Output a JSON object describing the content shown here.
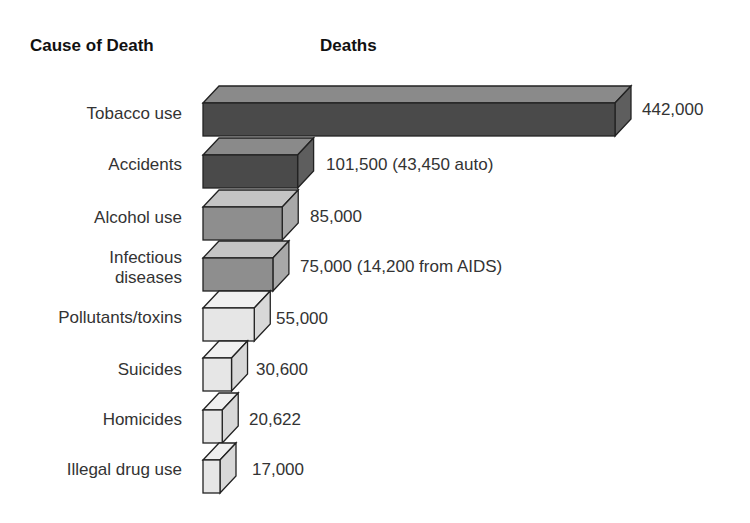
{
  "chart_data": {
    "type": "bar",
    "orientation": "horizontal",
    "style": "3d",
    "title": "",
    "xlabel": "Deaths",
    "ylabel": "Cause of Death",
    "categories": [
      "Tobacco use",
      "Accidents",
      "Alcohol use",
      "Infectious diseases",
      "Pollutants/toxins",
      "Suicides",
      "Homicides",
      "Illegal drug use"
    ],
    "values": [
      442000,
      101500,
      85000,
      75000,
      55000,
      30600,
      20622,
      17000
    ],
    "data_labels": [
      "442,000",
      "101,500 (43,450 auto)",
      "85,000",
      "75,000 (14,200 from AIDS)",
      "55,000",
      "30,600",
      "20,622",
      "17,000"
    ],
    "annotations": {
      "Accidents": "43,450 auto",
      "Infectious diseases": "14,200 from AIDS"
    },
    "grid": false,
    "legend": null
  },
  "headers": {
    "cause": "Cause of Death",
    "deaths": "Deaths"
  },
  "rows": [
    {
      "label": "Tobacco use",
      "value_label": "442,000",
      "front": "#4a4a4a",
      "top": "#8a8a8a",
      "side": "#5e5e5e"
    },
    {
      "label": "Accidents",
      "value_label": "101,500 (43,450 auto)",
      "front": "#4a4a4a",
      "top": "#8a8a8a",
      "side": "#5e5e5e"
    },
    {
      "label": "Alcohol use",
      "value_label": "85,000",
      "front": "#8e8e8e",
      "top": "#c4c4c4",
      "side": "#a8a8a8"
    },
    {
      "label_line1": "Infectious",
      "label_line2": "diseases",
      "value_label": "75,000 (14,200 from AIDS)",
      "front": "#8e8e8e",
      "top": "#c4c4c4",
      "side": "#a8a8a8"
    },
    {
      "label": "Pollutants/toxins",
      "value_label": "55,000",
      "front": "#e6e6e6",
      "top": "#f0f0f0",
      "side": "#d8d8d8"
    },
    {
      "label": "Suicides",
      "value_label": "30,600",
      "front": "#e6e6e6",
      "top": "#f0f0f0",
      "side": "#d8d8d8"
    },
    {
      "label": "Homicides",
      "value_label": "20,622",
      "front": "#e6e6e6",
      "top": "#f0f0f0",
      "side": "#d8d8d8"
    },
    {
      "label": "Illegal drug use",
      "value_label": "17,000",
      "front": "#e6e6e6",
      "top": "#f0f0f0",
      "side": "#d8d8d8"
    }
  ]
}
